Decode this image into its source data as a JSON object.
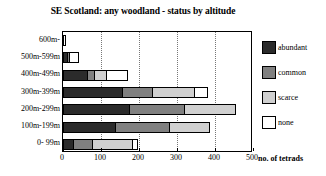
{
  "chart_data": {
    "type": "bar",
    "orientation": "horizontal",
    "stacked": true,
    "title": "SE Scotland: any woodland - status by altitude",
    "xlabel": "no. of tetrads",
    "ylabel": "",
    "xlim": [
      0,
      500
    ],
    "xticks": [
      0,
      100,
      200,
      300,
      400,
      500
    ],
    "grid": "vertical-dotted",
    "legend_position": "right",
    "categories": [
      "600m-",
      "500m-599m",
      "400m-499m",
      "300m-399m",
      "200m-299m",
      "100m-199m",
      "0- 99m"
    ],
    "series": [
      {
        "name": "abundant",
        "color": "#2b2b2b",
        "values": [
          0,
          8,
          63,
          155,
          172,
          137,
          23
        ]
      },
      {
        "name": "common",
        "color": "#808080",
        "values": [
          0,
          8,
          18,
          79,
          147,
          142,
          52
        ]
      },
      {
        "name": "scarce",
        "color": "#d0d0d0",
        "values": [
          0,
          0,
          34,
          114,
          136,
          108,
          110
        ]
      },
      {
        "name": "none",
        "color": "#ffffff",
        "values": [
          8,
          26,
          55,
          34,
          0,
          0,
          13
        ]
      }
    ],
    "totals": [
      8,
      42,
      170,
      382,
      455,
      387,
      198
    ]
  },
  "legend": {
    "items": [
      {
        "label": "abundant",
        "color": "#2b2b2b"
      },
      {
        "label": "common",
        "color": "#808080"
      },
      {
        "label": "scarce",
        "color": "#d0d0d0"
      },
      {
        "label": "none",
        "color": "#ffffff"
      }
    ]
  }
}
